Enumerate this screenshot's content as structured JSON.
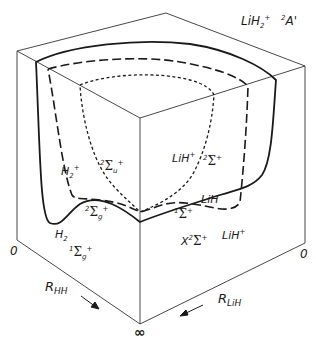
{
  "title": {
    "molecule": "LiH",
    "molecule_sub": "2",
    "molecule_sup": "+",
    "state": "²A'",
    "state_pre": "2",
    "state_main": "A'"
  },
  "axes": {
    "r_hh": {
      "main": "R",
      "sub": "HH"
    },
    "r_lih": {
      "main": "R",
      "sub": "LiH"
    },
    "origin_left": "0",
    "origin_right": "0",
    "infinity": "∞"
  },
  "curves": {
    "solid": {
      "style": "solid",
      "description": "ground state surface contour"
    },
    "long_dash": {
      "style": "long-dashed",
      "description": "H2+ 2Σg+ / LiH 1Σ+ asymptote contour"
    },
    "short_dash": {
      "style": "short-dashed",
      "description": "H2+ 2Σu+ / LiH+ 2Σ+ contour"
    }
  },
  "labels": {
    "h2plus": {
      "main": "H",
      "sub": "2",
      "sup": "+"
    },
    "sigma_u": {
      "pre": "2",
      "sym": "Σ",
      "sub": "u",
      "sup": "+"
    },
    "sigma_g_2": {
      "pre": "2",
      "sym": "Σ",
      "sub": "g",
      "sup": "+"
    },
    "h2": {
      "main": "H",
      "sub": "2"
    },
    "sigma_g_1": {
      "pre": "1",
      "sym": "Σ",
      "sub": "g",
      "sup": "+"
    },
    "lihplus_upper": {
      "main": "LiH",
      "sup": "+"
    },
    "sigma_2plus": {
      "pre": "2",
      "sym": "Σ",
      "sup": "+"
    },
    "lih": {
      "main": "LiH"
    },
    "sigma_1plus": {
      "pre": "1",
      "sym": "Σ",
      "sup": "+"
    },
    "x_state": {
      "main": "X",
      "pre": "2",
      "sym": "Σ",
      "sup": "+"
    },
    "lihplus_lower": {
      "main": "LiH",
      "sup": "+"
    }
  },
  "colors": {
    "background": "#ffffff",
    "ink": "#1a1a1a",
    "box": "#333333"
  }
}
